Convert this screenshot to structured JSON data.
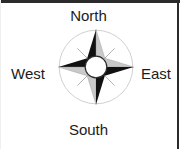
{
  "figure": {
    "type": "compass-rose",
    "title": "",
    "background_color": "#ffffff",
    "border_color": "#2b2b2b",
    "points_count": 8,
    "center_circle_color": "#ffffff",
    "dark_point_color": "#111111",
    "light_point_color": "#c9c9c9",
    "outline_circle_color": "#bdbdbd"
  },
  "labels": {
    "north": "North",
    "south": "South",
    "west": "West",
    "east": "East"
  }
}
